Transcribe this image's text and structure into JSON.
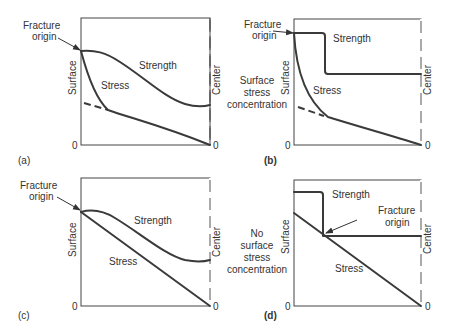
{
  "figure": {
    "panels": [
      {
        "id": "a",
        "label": "(a)",
        "axis_left": "Surface",
        "axis_right": "Center",
        "zero_left": "0",
        "zero_right": "0",
        "curve_strength": "Strength",
        "curve_stress": "Stress",
        "annotation": "Fracture\norigin",
        "annotation_lines": [
          "Fracture",
          "origin"
        ],
        "side_note_lines": []
      },
      {
        "id": "b",
        "label": "(b)",
        "axis_left": "Surface",
        "axis_right": "Center",
        "zero_left": "0",
        "zero_right": "0",
        "curve_strength": "Strength",
        "curve_stress": "Stress",
        "annotation_lines": [
          "Fracture",
          "origin"
        ],
        "side_note_lines": [
          "Surface",
          "stress",
          "concentration"
        ]
      },
      {
        "id": "c",
        "label": "(c)",
        "axis_left": "Surface",
        "axis_right": "Center",
        "zero_left": "0",
        "zero_right": "0",
        "curve_strength": "Strength",
        "curve_stress": "Stress",
        "annotation_lines": [
          "Fracture",
          "origin"
        ],
        "side_note_lines": [
          "No",
          "surface",
          "stress",
          "concentration"
        ]
      },
      {
        "id": "d",
        "label": "(d)",
        "axis_left": "Surface",
        "axis_right": "Center",
        "zero_left": "0",
        "zero_right": "0",
        "curve_strength": "Strength",
        "curve_stress": "Stress",
        "annotation_lines": [
          "Fracture",
          "origin"
        ],
        "side_note_lines": []
      }
    ],
    "colors": {
      "line": "#3a3a3a",
      "text": "#333333",
      "background": "#ffffff"
    }
  }
}
